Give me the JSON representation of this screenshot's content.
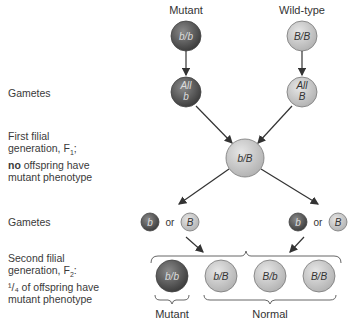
{
  "parents": {
    "mutant": {
      "label": "Mutant",
      "genotype": "b/b"
    },
    "wild": {
      "label": "Wild-type",
      "genotype": "B/B"
    }
  },
  "gametes_label": "Gametes",
  "parent_gametes": {
    "mutant": {
      "line1": "All",
      "line2": "b"
    },
    "wild": {
      "line1": "All",
      "line2": "B"
    }
  },
  "f1": {
    "label_line1": "First filial",
    "label_line2": "generation, F",
    "label_sub": "1",
    "label_line2_end": ";",
    "label_bold": "no",
    "label_line3_rest": " offspring have",
    "label_line4": "mutant phenotype",
    "genotype": "b/B"
  },
  "f1_gametes": {
    "label": "Gametes",
    "left": {
      "a": "b",
      "or": "or",
      "b": "B"
    },
    "right": {
      "a": "b",
      "or": "or",
      "b": "B"
    }
  },
  "f2": {
    "label_line1": "Second filial",
    "label_line2": "generation, F",
    "label_sub": "2",
    "label_line2_end": ":",
    "label_line3": "¹/₄ of offspring have",
    "label_line4": "mutant phenotype",
    "offspring": [
      "b/b",
      "b/B",
      "B/b",
      "B/B"
    ],
    "mutant_label": "Mutant",
    "normal_label": "Normal"
  },
  "colors": {
    "dark": "#555555",
    "light": "#c8c8c8",
    "arrow": "#333333"
  }
}
